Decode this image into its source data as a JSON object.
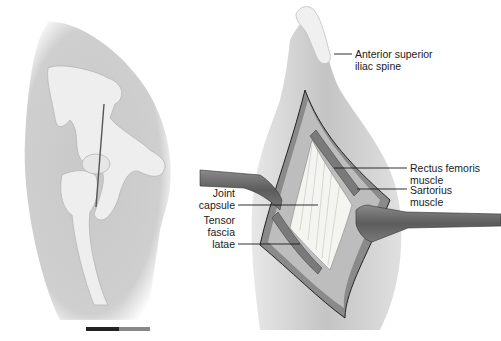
{
  "figure": {
    "panels": [
      {
        "id": "left",
        "description": "Lateral view of hip with pelvis and femur, vertical incision line marked"
      },
      {
        "id": "right",
        "description": "Anterior surgical approach to hip showing retracted incision exposing joint capsule"
      }
    ],
    "labels": {
      "asis": "Anterior superior\niliac spine",
      "rectus": "Rectus femoris\nmuscle",
      "sartorius": "Sartorius\nmuscle",
      "joint_capsule": "Joint\ncapsule",
      "tfl": "Tensor\nfascia\nlatae"
    },
    "colors": {
      "skin": "#cfcfcf",
      "bone": "#ececec",
      "retractor": "#6e6e6e",
      "capsule": "#f4f4f0",
      "tissue": "#9a9a9a",
      "outline": "#2a2a2a"
    }
  }
}
